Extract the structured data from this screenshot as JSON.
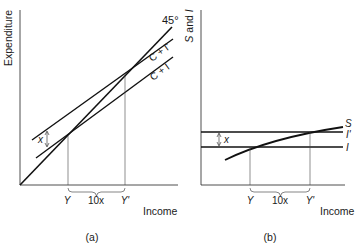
{
  "panels": [
    {
      "id": "a",
      "caption": "(a)",
      "ylabel": "Expenditure",
      "xlabel": "Income",
      "lines": [
        {
          "name": "45°",
          "label": "45°"
        },
        {
          "name": "C+I'",
          "label": "C + I'"
        },
        {
          "name": "C+I",
          "label": "C + I"
        }
      ],
      "shift_label": "x",
      "x_marks": [
        "Y",
        "Y'"
      ],
      "bracket_label": "10x"
    },
    {
      "id": "b",
      "caption": "(b)",
      "ylabel": "S and I",
      "xlabel": "Income",
      "lines": [
        {
          "name": "S",
          "label": "S"
        },
        {
          "name": "I'",
          "label": "I'"
        },
        {
          "name": "I",
          "label": "I"
        }
      ],
      "shift_label": "x",
      "x_marks": [
        "Y",
        "Y'"
      ],
      "bracket_label": "10x"
    }
  ]
}
